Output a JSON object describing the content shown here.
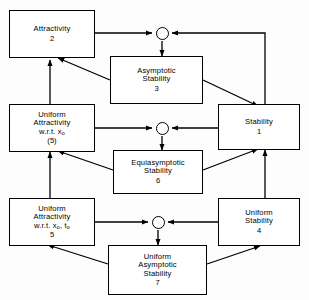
{
  "figure": {
    "kind": "stability-concepts-implication-diagram",
    "background_color": "#fdfdfd",
    "line_color": "#000000",
    "box_fill": "#ffffff"
  },
  "nodes": {
    "attractivity": {
      "line1": "Attractivity",
      "number": "2"
    },
    "asymptotic_stability": {
      "line1": "Asymptotic",
      "line2": "Stability",
      "number": "3"
    },
    "uniform_attractivity_x": {
      "line1": "Uniform",
      "line2": "Attractivity",
      "line3": "w.r.t.  x",
      "line3_sub": "o",
      "number": "(5)"
    },
    "stability": {
      "line1": "Stability",
      "number": "1"
    },
    "equiasymptotic_stability": {
      "line1": "Equiasymptotic",
      "line2": "Stability",
      "number": "6"
    },
    "uniform_attractivity_xt": {
      "line1": "Uniform",
      "line2": "Attractivity",
      "line3a": "w.r.t.  x",
      "line3a_sub": "o",
      "line3b": ", t",
      "line3b_sub": "o",
      "number": "5"
    },
    "uniform_stability": {
      "line1": "Uniform",
      "line2": "Stability",
      "number": "4"
    },
    "uniform_asymptotic_stability": {
      "line1": "Uniform",
      "line2": "Asymptotic",
      "line3": "Stability",
      "number": "7"
    }
  },
  "junctions": [
    {
      "name": "junction-top",
      "inputs": [
        "attractivity",
        "stability"
      ],
      "output": "asymptotic_stability"
    },
    {
      "name": "junction-middle",
      "inputs": [
        "uniform_attractivity_x",
        "stability"
      ],
      "output": "equiasymptotic_stability"
    },
    {
      "name": "junction-bottom",
      "inputs": [
        "uniform_attractivity_xt",
        "uniform_stability"
      ],
      "output": "uniform_asymptotic_stability"
    }
  ],
  "edges": [
    {
      "from": "asymptotic_stability",
      "to": "attractivity",
      "style": "diagonal"
    },
    {
      "from": "asymptotic_stability",
      "to": "stability",
      "style": "diagonal"
    },
    {
      "from": "equiasymptotic_stability",
      "to": "uniform_attractivity_x",
      "style": "diagonal"
    },
    {
      "from": "equiasymptotic_stability",
      "to": "stability",
      "style": "diagonal"
    },
    {
      "from": "uniform_asymptotic_stability",
      "to": "uniform_attractivity_xt",
      "style": "diagonal"
    },
    {
      "from": "uniform_asymptotic_stability",
      "to": "uniform_stability",
      "style": "diagonal"
    },
    {
      "from": "uniform_attractivity_x",
      "to": "attractivity",
      "style": "vertical"
    },
    {
      "from": "uniform_attractivity_xt",
      "to": "uniform_attractivity_x",
      "style": "vertical"
    },
    {
      "from": "uniform_stability",
      "to": "stability",
      "style": "vertical"
    }
  ]
}
